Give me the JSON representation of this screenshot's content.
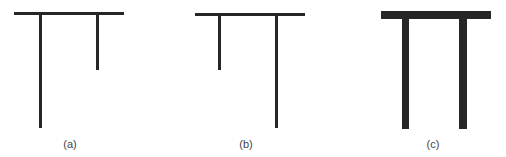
{
  "figures": [
    {
      "id": "a",
      "label": "(a)",
      "stroke": "thin",
      "description": "T-shaped structure: long left leg, short right leg",
      "horizontal": {
        "x": 14,
        "y": 12,
        "w": 110,
        "h": 3
      },
      "legs": [
        {
          "position": "left",
          "length": "long",
          "x": 39,
          "y": 14,
          "w": 3,
          "h": 114
        },
        {
          "position": "right",
          "length": "short",
          "x": 96,
          "y": 14,
          "w": 3,
          "h": 56
        }
      ],
      "label_pos": {
        "x": 55,
        "y": 138
      }
    },
    {
      "id": "b",
      "label": "(b)",
      "stroke": "thin",
      "description": "T-shaped structure: short left leg, long right leg",
      "horizontal": {
        "x": 195,
        "y": 13,
        "w": 110,
        "h": 3
      },
      "legs": [
        {
          "position": "left",
          "length": "short",
          "x": 218,
          "y": 15,
          "w": 3,
          "h": 55
        },
        {
          "position": "right",
          "length": "long",
          "x": 275,
          "y": 15,
          "w": 3,
          "h": 113
        }
      ],
      "label_pos": {
        "x": 231,
        "y": 138
      }
    },
    {
      "id": "c",
      "label": "(c)",
      "stroke": "thick",
      "description": "Pi-shaped structure: two equal thick legs",
      "horizontal": {
        "x": 381,
        "y": 11,
        "w": 110,
        "h": 8
      },
      "legs": [
        {
          "position": "left",
          "length": "long",
          "x": 402,
          "y": 18,
          "w": 7,
          "h": 111
        },
        {
          "position": "right",
          "length": "long",
          "x": 459,
          "y": 18,
          "w": 8,
          "h": 111
        }
      ],
      "label_pos": {
        "x": 418,
        "y": 138
      }
    }
  ],
  "colors": {
    "stroke": "#262626",
    "label": "#444444",
    "background": "#ffffff"
  }
}
